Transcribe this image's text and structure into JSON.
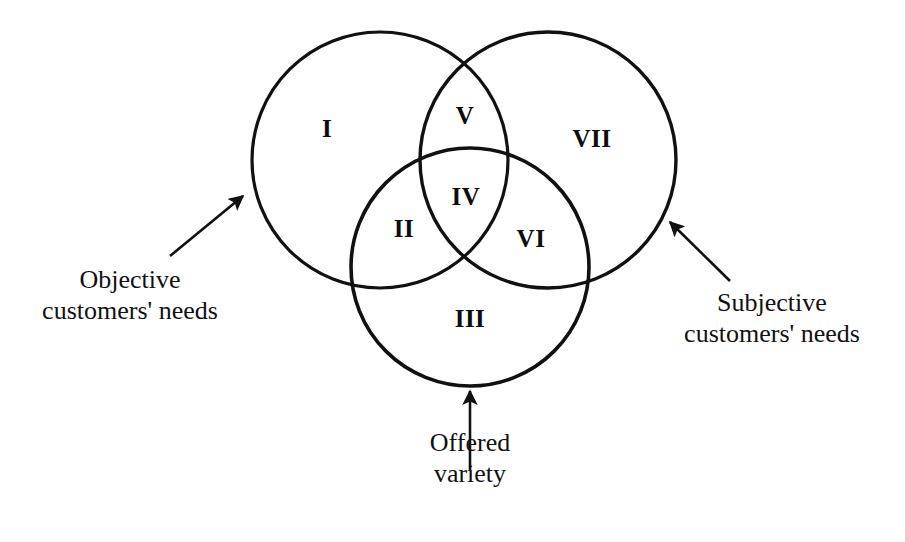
{
  "diagram": {
    "type": "venn",
    "title": "",
    "stroke_color": "#111111",
    "fill_color": "transparent",
    "background_color": "#ffffff",
    "circles": [
      {
        "id": "objective-customers-needs",
        "name": "Objective customers' needs",
        "cx": 380,
        "cy": 160,
        "r": 128
      },
      {
        "id": "subjective-customers-needs",
        "name": "Subjective customers' needs",
        "cx": 548,
        "cy": 160,
        "r": 128
      },
      {
        "id": "offered-variety",
        "name": "Offered variety",
        "cx": 470,
        "cy": 267,
        "r": 119
      }
    ],
    "regions": [
      {
        "id": "region-1",
        "label": "I",
        "x": 327,
        "y": 128,
        "meaning": "Objective customers' needs only"
      },
      {
        "id": "region-2",
        "label": "II",
        "x": 404,
        "y": 228,
        "meaning": "Objective customers' needs and Offered variety"
      },
      {
        "id": "region-3",
        "label": "III",
        "x": 470,
        "y": 318,
        "meaning": "Offered variety only"
      },
      {
        "id": "region-4",
        "label": "IV",
        "x": 466,
        "y": 196,
        "meaning": "All three"
      },
      {
        "id": "region-5",
        "label": "V",
        "x": 465,
        "y": 115,
        "meaning": "Objective and Subjective customers' needs"
      },
      {
        "id": "region-6",
        "label": "VI",
        "x": 531,
        "y": 238,
        "meaning": "Subjective customers' needs and Offered variety"
      },
      {
        "id": "region-7",
        "label": "VII",
        "x": 592,
        "y": 138,
        "meaning": "Subjective customers' needs only"
      }
    ],
    "callouts": [
      {
        "id": "callout-objective",
        "lines": [
          "Objective",
          "customers' needs"
        ],
        "text_x": 130,
        "text_y": 265,
        "arrow": {
          "x1": 170,
          "y1": 256,
          "x2": 243,
          "y2": 196
        }
      },
      {
        "id": "callout-subjective",
        "lines": [
          "Subjective",
          "customers' needs"
        ],
        "text_x": 772,
        "text_y": 288,
        "arrow": {
          "x1": 730,
          "y1": 281,
          "x2": 670,
          "y2": 222
        }
      },
      {
        "id": "callout-offered",
        "lines": [
          "Offered",
          "variety"
        ],
        "text_x": 470,
        "text_y": 428,
        "arrow": {
          "x1": 470,
          "y1": 470,
          "x2": 470,
          "y2": 391
        }
      }
    ]
  }
}
